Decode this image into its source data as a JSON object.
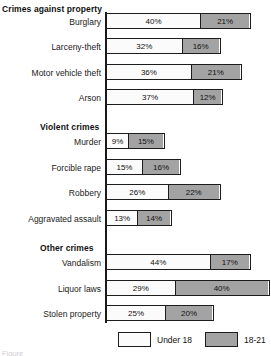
{
  "chart_data": {
    "type": "bar",
    "title": "",
    "xlabel": "",
    "ylabel": "",
    "orientation": "horizontal",
    "stacked": true,
    "grid": false,
    "legend_position": "bottom",
    "xlim": [
      0,
      70
    ],
    "px_per_percent": 2.33,
    "legend": [
      {
        "label": "Under 18",
        "color": "#fbfbfb"
      },
      {
        "label": "18-21",
        "color": "#a3a3a3"
      }
    ],
    "series": [
      {
        "name": "Under 18",
        "values": [
          40,
          32,
          36,
          37,
          9,
          15,
          26,
          13,
          44,
          29,
          25
        ]
      },
      {
        "name": "18-21",
        "values": [
          21,
          16,
          21,
          12,
          15,
          16,
          22,
          14,
          17,
          40,
          20
        ]
      }
    ],
    "categories": [
      "Burglary",
      "Larceny-theft",
      "Motor vehicle theft",
      "Arson",
      "Murder",
      "Forcible rape",
      "Robbery",
      "Aggravated assault",
      "Vandalism",
      "Liquor laws",
      "Stolen property"
    ],
    "groups": [
      {
        "header": "Crimes against property",
        "header_top": 4,
        "indent": 1,
        "rows": [
          {
            "label": "Burglary",
            "under18": 40,
            "age1821": 21,
            "top": 13,
            "label_top": 17
          },
          {
            "label": "Larceny-theft",
            "under18": 32,
            "age1821": 16,
            "top": 38,
            "label_top": 42
          },
          {
            "label": "Motor vehicle theft",
            "under18": 36,
            "age1821": 21,
            "top": 64,
            "label_top": 68
          },
          {
            "label": "Arson",
            "under18": 37,
            "age1821": 12,
            "top": 89,
            "label_top": 93
          }
        ]
      },
      {
        "header": "Violent crimes",
        "header_top": 122,
        "indent": 2,
        "rows": [
          {
            "label": "Murder",
            "under18": 9,
            "age1821": 15,
            "top": 133,
            "label_top": 137
          },
          {
            "label": "Forcible rape",
            "under18": 15,
            "age1821": 16,
            "top": 159,
            "label_top": 163
          },
          {
            "label": "Robbery",
            "under18": 26,
            "age1821": 22,
            "top": 184,
            "label_top": 188
          },
          {
            "label": "Aggravated assault",
            "under18": 13,
            "age1821": 14,
            "top": 210,
            "label_top": 214
          }
        ]
      },
      {
        "header": "Other crimes",
        "header_top": 243,
        "indent": 3,
        "rows": [
          {
            "label": "Vandalism",
            "under18": 44,
            "age1821": 17,
            "top": 254,
            "label_top": 258
          },
          {
            "label": "Liquor laws",
            "under18": 29,
            "age1821": 40,
            "top": 280,
            "label_top": 284
          },
          {
            "label": "Stolen property",
            "under18": 25,
            "age1821": 20,
            "top": 305,
            "label_top": 309
          }
        ]
      }
    ],
    "value_suffix": "%"
  },
  "caption_stub": "Figure"
}
